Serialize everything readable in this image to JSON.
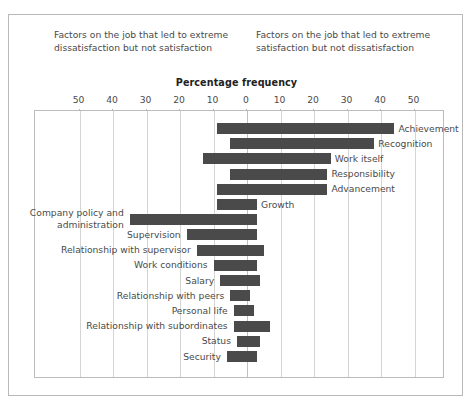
{
  "captions": {
    "left": "Factors on the job that led to extreme dissatisfaction but not satisfaction",
    "right": "Factors on the job that led to extreme satisfaction but not dissatisfaction"
  },
  "axis_title": "Percentage frequency",
  "ticks": [
    "50",
    "40",
    "30",
    "20",
    "10",
    "0",
    "10",
    "20",
    "30",
    "40",
    "50"
  ],
  "chart_data": {
    "type": "bar",
    "orientation": "horizontal",
    "style": "diverging-bidirectional",
    "title": "Percentage frequency",
    "subtitle_left": "Factors on the job that led to extreme dissatisfaction but not satisfaction",
    "subtitle_right": "Factors on the job that led to extreme satisfaction but not dissatisfaction",
    "xlabel": "Percentage frequency",
    "ylabel": "",
    "xlim": [
      -50,
      50
    ],
    "xticks": [
      -50,
      -40,
      -30,
      -20,
      -10,
      0,
      10,
      20,
      30,
      40,
      50
    ],
    "xtick_labels": [
      "50",
      "40",
      "30",
      "20",
      "10",
      "0",
      "10",
      "20",
      "30",
      "40",
      "50"
    ],
    "grid": true,
    "legend": null,
    "bar_color": "#4a4a4a",
    "note": "Herzberg two-factor theory. 'left' = percent frequency reported as dissatisfier, 'right' = percent frequency reported as satisfier.",
    "categories": [
      "Achievement",
      "Recognition",
      "Work itself",
      "Responsibility",
      "Advancement",
      "Growth",
      "Company policy and administration",
      "Supervision",
      "Relationship with supervisor",
      "Work conditions",
      "Salary",
      "Relationship with peers",
      "Personal life",
      "Relationship with subordinates",
      "Status",
      "Security"
    ],
    "series": [
      {
        "name": "Dissatisfiers (left of zero)",
        "values": [
          9,
          5,
          13,
          5,
          9,
          9,
          35,
          18,
          15,
          10,
          8,
          5,
          4,
          4,
          3,
          6
        ]
      },
      {
        "name": "Satisfiers (right of zero)",
        "values": [
          44,
          38,
          25,
          24,
          24,
          3,
          3,
          3,
          5,
          3,
          4,
          1,
          2,
          7,
          4,
          3
        ]
      }
    ],
    "bars": [
      {
        "label": "Achievement",
        "left": 9,
        "right": 44,
        "label_side": "right"
      },
      {
        "label": "Recognition",
        "left": 5,
        "right": 38,
        "label_side": "right"
      },
      {
        "label": "Work itself",
        "left": 13,
        "right": 25,
        "label_side": "right"
      },
      {
        "label": "Responsibility",
        "left": 5,
        "right": 24,
        "label_side": "right"
      },
      {
        "label": "Advancement",
        "left": 9,
        "right": 24,
        "label_side": "right"
      },
      {
        "label": "Growth",
        "left": 9,
        "right": 3,
        "label_side": "right"
      },
      {
        "label": "Company policy and administration",
        "left": 35,
        "right": 3,
        "label_side": "left"
      },
      {
        "label": "Supervision",
        "left": 18,
        "right": 3,
        "label_side": "left"
      },
      {
        "label": "Relationship with supervisor",
        "left": 15,
        "right": 5,
        "label_side": "left"
      },
      {
        "label": "Work conditions",
        "left": 10,
        "right": 3,
        "label_side": "left"
      },
      {
        "label": "Salary",
        "left": 8,
        "right": 4,
        "label_side": "left"
      },
      {
        "label": "Relationship with peers",
        "left": 5,
        "right": 1,
        "label_side": "left"
      },
      {
        "label": "Personal life",
        "left": 4,
        "right": 2,
        "label_side": "left"
      },
      {
        "label": "Relationship with subordinates",
        "left": 4,
        "right": 7,
        "label_side": "left"
      },
      {
        "label": "Status",
        "left": 3,
        "right": 4,
        "label_side": "left"
      },
      {
        "label": "Security",
        "left": 6,
        "right": 3,
        "label_side": "left"
      }
    ]
  }
}
